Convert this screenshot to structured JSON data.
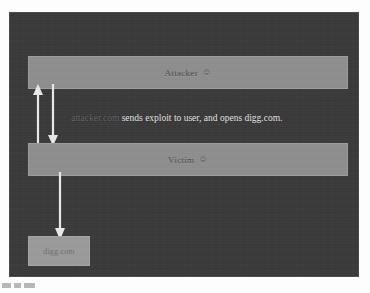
{
  "slide": {
    "background_color": "#3a3a3a",
    "border_color": "#4a4a4a"
  },
  "diagram": {
    "type": "attack-flow-diagram",
    "nodes": [
      {
        "id": "attacker",
        "label": "Attacker",
        "glyph": "☺",
        "glyph_name": "smiley-face-icon",
        "fill_color": "#8e8e8e",
        "text_color": "#4a4a4a"
      },
      {
        "id": "victim",
        "label": "Victim",
        "glyph": "☺",
        "glyph_name": "smiley-face-icon",
        "fill_color": "#8e8e8e",
        "text_color": "#4a4a4a"
      },
      {
        "id": "digg",
        "label": "digg.com",
        "fill_color": "#9a9a9a",
        "text_color": "#6e6e6e"
      }
    ],
    "edges": [
      {
        "id": "victim-to-attacker",
        "from": "victim",
        "to": "attacker",
        "direction": "up",
        "color": "#e9e9e9"
      },
      {
        "id": "attacker-to-victim",
        "from": "attacker",
        "to": "victim",
        "direction": "down",
        "color": "#e9e9e9"
      },
      {
        "id": "victim-to-digg",
        "from": "victim",
        "to": "digg",
        "direction": "down",
        "color": "#e9e9e9"
      }
    ],
    "caption": {
      "domain": "attacker.com",
      "domain_color": "#6c6c6c",
      "rest": " sends exploit to user, and opens digg.com.",
      "rest_color": "#ececec",
      "full_text": "attacker.com sends exploit to user, and opens digg.com."
    }
  }
}
